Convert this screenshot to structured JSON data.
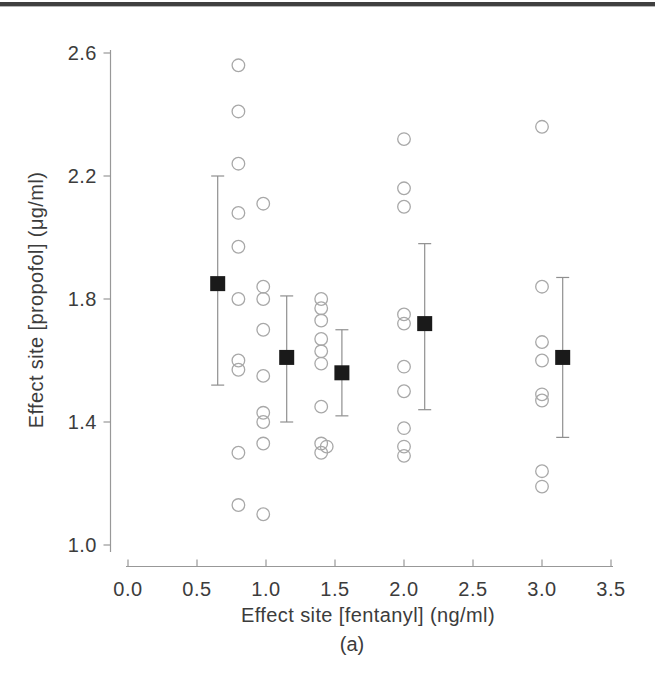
{
  "figure": {
    "caption": "(a)"
  },
  "style": {
    "background": "#ffffff",
    "top_rule_color": "#404040",
    "text_color": "#3c3c3c",
    "axis_color": "#989898",
    "circle_stroke": "#a8a8a8",
    "square_fill": "#1a1a1a",
    "error_bar_color": "#8f8f8f"
  },
  "chart_data": {
    "type": "scatter",
    "title": "",
    "xlabel": "Effect site [fentanyl] (ng/ml)",
    "ylabel": "Effect site [propofol] (μg/ml)",
    "caption": "(a)",
    "xlim": [
      0.0,
      3.5
    ],
    "ylim": [
      1.0,
      2.6
    ],
    "xticks": [
      0.0,
      0.5,
      1.0,
      1.5,
      2.0,
      2.5,
      3.0,
      3.5
    ],
    "xtick_labels": [
      "0.0",
      "0.5",
      "1.0",
      "1.5",
      "2.0",
      "2.5",
      "3.0",
      "3.5"
    ],
    "yticks": [
      1.0,
      1.4,
      1.8,
      2.2,
      2.6
    ],
    "ytick_labels": [
      "1.0",
      "1.4",
      "1.8",
      "2.2",
      "2.6"
    ],
    "grid": false,
    "legend_position": "none",
    "series": [
      {
        "name": "individual observations",
        "marker": "open-circle",
        "points": [
          [
            0.8,
            2.56
          ],
          [
            0.8,
            2.41
          ],
          [
            0.8,
            2.24
          ],
          [
            0.8,
            2.08
          ],
          [
            0.8,
            1.97
          ],
          [
            0.8,
            1.8
          ],
          [
            0.8,
            1.6
          ],
          [
            0.8,
            1.57
          ],
          [
            0.8,
            1.3
          ],
          [
            0.8,
            1.13
          ],
          [
            0.98,
            2.11
          ],
          [
            0.98,
            1.84
          ],
          [
            0.98,
            1.8
          ],
          [
            0.98,
            1.7
          ],
          [
            0.98,
            1.55
          ],
          [
            0.98,
            1.43
          ],
          [
            0.98,
            1.4
          ],
          [
            0.98,
            1.33
          ],
          [
            0.98,
            1.1
          ],
          [
            1.4,
            1.8
          ],
          [
            1.4,
            1.77
          ],
          [
            1.4,
            1.73
          ],
          [
            1.4,
            1.67
          ],
          [
            1.4,
            1.63
          ],
          [
            1.4,
            1.59
          ],
          [
            1.4,
            1.45
          ],
          [
            1.4,
            1.33
          ],
          [
            1.44,
            1.32
          ],
          [
            1.4,
            1.3
          ],
          [
            2.0,
            2.32
          ],
          [
            2.0,
            2.16
          ],
          [
            2.0,
            2.1
          ],
          [
            2.0,
            1.75
          ],
          [
            2.0,
            1.72
          ],
          [
            2.0,
            1.58
          ],
          [
            2.0,
            1.5
          ],
          [
            2.0,
            1.38
          ],
          [
            2.0,
            1.32
          ],
          [
            2.0,
            1.29
          ],
          [
            3.0,
            2.36
          ],
          [
            3.0,
            1.84
          ],
          [
            3.0,
            1.66
          ],
          [
            3.0,
            1.6
          ],
          [
            3.0,
            1.49
          ],
          [
            3.0,
            1.47
          ],
          [
            3.0,
            1.24
          ],
          [
            3.0,
            1.19
          ]
        ]
      },
      {
        "name": "mean with error bars",
        "marker": "filled-square",
        "points": [
          {
            "x": 0.65,
            "y": 1.85,
            "lo": 1.52,
            "hi": 2.2
          },
          {
            "x": 1.15,
            "y": 1.61,
            "lo": 1.4,
            "hi": 1.81
          },
          {
            "x": 1.55,
            "y": 1.56,
            "lo": 1.42,
            "hi": 1.7
          },
          {
            "x": 2.15,
            "y": 1.72,
            "lo": 1.44,
            "hi": 1.98
          },
          {
            "x": 3.15,
            "y": 1.61,
            "lo": 1.35,
            "hi": 1.87
          }
        ]
      }
    ]
  }
}
